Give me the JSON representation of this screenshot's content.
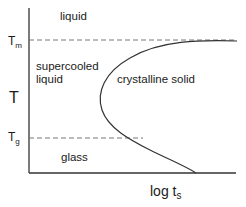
{
  "diagram": {
    "y_axis": {
      "label": "T",
      "ticks": [
        {
          "main": "T",
          "sub": "m"
        },
        {
          "main": "T",
          "sub": "g"
        }
      ]
    },
    "x_axis": {
      "label_main": "log t",
      "label_sub": "s"
    },
    "regions": {
      "liquid": "liquid",
      "supercooled_line1": "supercooled",
      "supercooled_line2": "liquid",
      "crystalline": "crystalline solid",
      "glass": "glass"
    },
    "colors": {
      "line": "#333333",
      "dash": "#777777",
      "text": "#1a1a1a"
    }
  }
}
